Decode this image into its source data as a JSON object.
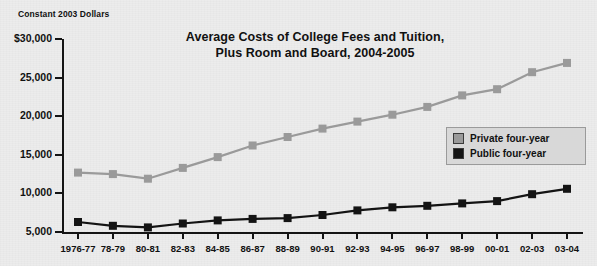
{
  "caption": "Constant 2003 Dollars",
  "title": {
    "line1": "Average Costs of College Fees and Tuition,",
    "line2": "Plus Room and Board, 2004-2005"
  },
  "legend": {
    "items": [
      {
        "label": "Private four-year",
        "color": "#9a9a9a"
      },
      {
        "label": "Public four-year",
        "color": "#141414"
      }
    ]
  },
  "colors": {
    "private": "#9a9a9a",
    "public": "#141414",
    "axis": "#141414",
    "background": "#ececec",
    "legend_background": "#d8d8d8",
    "legend_border": "#9a9a9a"
  },
  "chart_data": {
    "type": "line",
    "title": "Average Costs of College Fees and Tuition, Plus Room and Board, 2004-2005",
    "xlabel": "",
    "ylabel": "Constant 2003 Dollars",
    "ylim": [
      5000,
      30000
    ],
    "ytick_values": [
      30000,
      25000,
      20000,
      15000,
      10000,
      5000
    ],
    "ytick_labels": [
      "$30,000",
      "25,000",
      "20,000",
      "15,000",
      "10,000",
      "5,000"
    ],
    "grid": false,
    "legend_position": "right",
    "categories": [
      "1976-77",
      "78-79",
      "80-81",
      "82-83",
      "84-85",
      "86-87",
      "88-89",
      "90-91",
      "92-93",
      "94-95",
      "96-97",
      "98-99",
      "00-01",
      "02-03",
      "03-04"
    ],
    "series": [
      {
        "name": "Private four-year",
        "color": "#9a9a9a",
        "values": [
          12700,
          12500,
          11900,
          13300,
          14700,
          16200,
          17300,
          18400,
          19300,
          20200,
          21200,
          22700,
          23500,
          25700,
          26900
        ]
      },
      {
        "name": "Public four-year",
        "color": "#141414",
        "values": [
          6300,
          5800,
          5600,
          6100,
          6500,
          6700,
          6800,
          7200,
          7800,
          8200,
          8400,
          8700,
          9000,
          9900,
          10600
        ]
      }
    ]
  }
}
